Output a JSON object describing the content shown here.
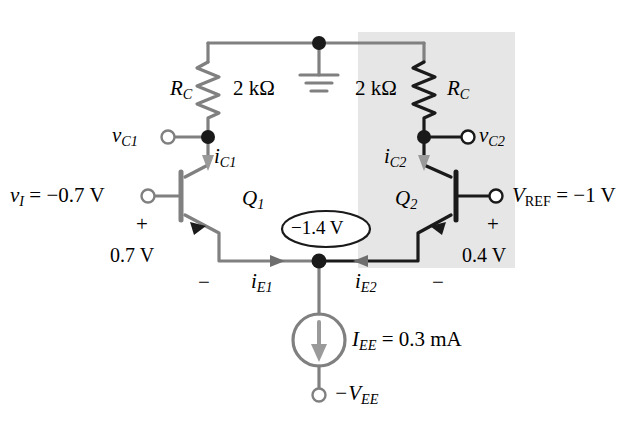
{
  "figure": {
    "type": "circuit-schematic",
    "colors": {
      "wire_inactive": "#808080",
      "wire_active": "#1a1a1a",
      "shaded_region": "#e6e6e6",
      "background": "#ffffff",
      "text": "#000000"
    }
  },
  "shaded_region": {
    "name": "active-half-highlight",
    "x": 358,
    "y": 32,
    "width": 157,
    "height": 236
  },
  "labels": {
    "rc_left": {
      "text": "R",
      "sub": "C"
    },
    "rc_left_value": "2 kΩ",
    "rc_right": {
      "text": "R",
      "sub": "C"
    },
    "rc_right_value": "2 kΩ",
    "vc1": {
      "text": "v",
      "sub": "C1"
    },
    "vc2": {
      "text": "v",
      "sub": "C2"
    },
    "ic1": {
      "text": "i",
      "sub": "C1"
    },
    "ic2": {
      "text": "i",
      "sub": "C2"
    },
    "ie1": {
      "text": "i",
      "sub": "E1"
    },
    "ie2": {
      "text": "i",
      "sub": "E2"
    },
    "q1": {
      "text": "Q",
      "sub": "1"
    },
    "q2": {
      "text": "Q",
      "sub": "2"
    },
    "vi_input": "v_I = −0.7 V",
    "vi_name": {
      "text": "v",
      "sub": "I"
    },
    "vi_value": "= −0.7 V",
    "vref_name": {
      "text": "V",
      "sub": "REF"
    },
    "vref_value": "= −1 V",
    "vbe1_plus": "+",
    "vbe1_value": "0.7 V",
    "vbe1_minus": "−",
    "vbe2_plus": "+",
    "vbe2_value": "0.4 V",
    "vbe2_minus": "−",
    "emitter_node_voltage": "−1.4 V",
    "iee_name": {
      "text": "I",
      "sub": "EE"
    },
    "iee_value": "= 0.3 mA",
    "vee_terminal": {
      "text": "−V",
      "sub": "EE"
    }
  },
  "terminals": [
    {
      "name": "vc1-terminal",
      "x": 168,
      "y": 137
    },
    {
      "name": "vi-terminal",
      "x": 148,
      "y": 196
    },
    {
      "name": "vc2-terminal",
      "x": 468,
      "y": 137
    },
    {
      "name": "vref-terminal",
      "x": 496,
      "y": 196
    },
    {
      "name": "vee-terminal",
      "x": 319,
      "y": 395
    }
  ],
  "nodes": [
    {
      "name": "supply-ground-node",
      "x": 319,
      "y": 43
    },
    {
      "name": "collector1-node",
      "x": 208,
      "y": 137
    },
    {
      "name": "collector2-node",
      "x": 424,
      "y": 137
    },
    {
      "name": "emitter-common-node",
      "x": 319,
      "y": 261
    }
  ],
  "components": {
    "rc_left": {
      "name": "resistor-rc-left",
      "x": 208,
      "y_top": 62,
      "y_bottom": 118
    },
    "rc_right": {
      "name": "resistor-rc-right",
      "x": 424,
      "y_top": 62,
      "y_bottom": 118
    },
    "q1": {
      "name": "transistor-q1",
      "type": "npn",
      "orientation": "left-base"
    },
    "q2": {
      "name": "transistor-q2",
      "type": "npn",
      "orientation": "right-base"
    },
    "iee": {
      "name": "current-source-iee",
      "cx": 319,
      "cy": 340,
      "r": 26
    },
    "ground": {
      "name": "ground-symbol",
      "x": 319,
      "y": 63
    }
  },
  "chart_data": {
    "type": "table",
    "categories": [
      "R_C (left)",
      "R_C (right)",
      "v_I",
      "V_REF",
      "V_BE1",
      "V_BE2",
      "V_E (emitter node)",
      "I_EE"
    ],
    "values": [
      "2 kΩ",
      "2 kΩ",
      "−0.7 V",
      "−1 V",
      "0.7 V",
      "0.4 V",
      "−1.4 V",
      "0.3 mA"
    ]
  }
}
